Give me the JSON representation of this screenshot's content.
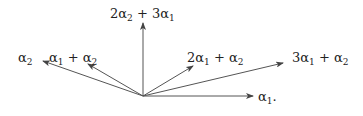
{
  "diagram": {
    "type": "root-system-vectors",
    "vectors": [
      {
        "id": "alpha2",
        "label_coeff1": "",
        "label_sym1": "α",
        "label_sub1": "2",
        "label_rest": "",
        "coords": [
          -1,
          0.35
        ]
      },
      {
        "id": "alpha1-plus-alpha2",
        "coords": [
          -0.55,
          0.32
        ]
      },
      {
        "id": "2alpha2-plus-3alpha1",
        "coords": [
          0,
          0.73
        ]
      },
      {
        "id": "2alpha1-plus-alpha2",
        "coords": [
          0.5,
          0.3
        ]
      },
      {
        "id": "3alpha1-plus-alpha2",
        "coords": [
          1.4,
          0.33
        ]
      },
      {
        "id": "alpha1",
        "coords": [
          1.1,
          0
        ]
      }
    ],
    "labels": {
      "alpha2": [
        "α",
        "2",
        "",
        "",
        ""
      ],
      "alpha1_plus_alpha2": [
        "α",
        "1",
        " + ",
        "α",
        "2"
      ],
      "two_alpha2_plus_three_alpha1": [
        "2α",
        "2",
        " + 3α",
        "1",
        ""
      ],
      "two_alpha1_plus_alpha2": [
        "2α",
        "1",
        " + ",
        "α",
        "2"
      ],
      "three_alpha1_plus_alpha2": [
        "3α",
        "1",
        " + ",
        "α",
        "2"
      ],
      "alpha1": [
        "α",
        "1",
        ".",
        "",
        ""
      ]
    }
  }
}
